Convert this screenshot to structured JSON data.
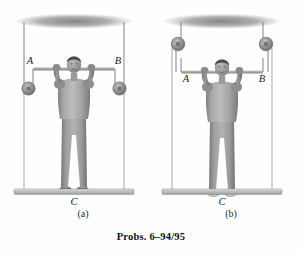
{
  "figure": {
    "caption": "Probs. 6–94/95",
    "panels": [
      {
        "id": "a",
        "label": "(a)",
        "point_labels": {
          "left": "A",
          "right": "B",
          "ground": "C"
        },
        "description": "Person standing on platform pulling down on a bar; cables run from bar over low side weights up to the ceiling",
        "pulley_position": "low"
      },
      {
        "id": "b",
        "label": "(b)",
        "point_labels": {
          "left": "A",
          "right": "B",
          "ground": "C"
        },
        "description": "Person standing on platform pulling down on a bar; cables run from bar up over high pulleys near the ceiling",
        "pulley_position": "high"
      }
    ],
    "colors": {
      "ceiling": "#8d8d8d",
      "floor": "#b9b9b9",
      "cable": "#8a8a8a",
      "bar": "#9a9a9a",
      "weight": "#8a8a8a",
      "body": "#9b9b9b",
      "hair": "#4f4f4f",
      "background": "#fefefe"
    }
  }
}
